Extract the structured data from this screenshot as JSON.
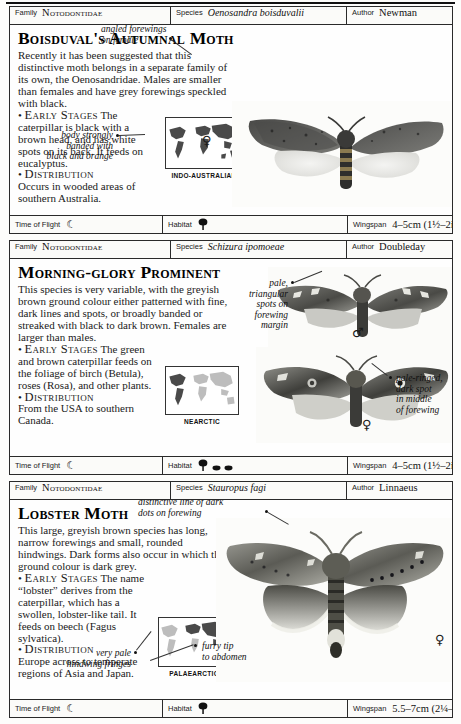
{
  "page": {
    "meta_labels": {
      "family": "Family",
      "species": "Species",
      "author": "Author"
    },
    "foot_labels": {
      "time_of_flight": "Time of Flight",
      "habitat": "Habitat",
      "wingspan": "Wingspan"
    }
  },
  "entries": [
    {
      "family": "Notodontidae",
      "species": "Oenosandra boisduvalii",
      "author": "Newman",
      "common_name": "Boisduval's Autumnal Moth",
      "description": "Recently it has been suggested that this distinctive moth belongs in a separate family of its own, the Oenosandridae. Males are smaller than females and have grey forewings speckled with black.",
      "early_stages_heading": "Early Stages",
      "early_stages": "The caterpillar is black with a brown head, and has white spots on its back. It feeds on eucalyptus.",
      "distribution_heading": "Distribution",
      "distribution": "Occurs in wooded areas of southern Australia.",
      "map_caption": "INDO-AUSTRALIAN",
      "annotations": [
        {
          "text_lines": [
            "angled forewings",
            "on female"
          ],
          "name": "annotation-angled-forewings"
        },
        {
          "text_lines": [
            "body strongly",
            "banded with",
            "black and orange"
          ],
          "name": "annotation-body-banded"
        }
      ],
      "sex_symbols": [
        "♀"
      ],
      "time_of_flight_icon": "moon-icon",
      "habitat_icons": [
        "tree-icon"
      ],
      "wingspan": "4–5cm (1½–2in)"
    },
    {
      "family": "Notodontidae",
      "species": "Schizura ipomoeae",
      "author": "Doubleday",
      "common_name": "Morning-glory Prominent",
      "description": "This species is very variable, with the greyish brown ground colour either patterned with fine, dark lines and spots, or broadly banded or streaked with black to dark brown. Females are larger than males.",
      "early_stages_heading": "Early Stages",
      "early_stages": "The green and brown caterpillar feeds on the foliage of birch (Betula), roses (Rosa), and other plants.",
      "distribution_heading": "Distribution",
      "distribution": "From the USA to southern Canada.",
      "map_caption": "NEARCTIC",
      "annotations": [
        {
          "text_lines": [
            "pale,",
            "triangular",
            "spots on",
            "forewing",
            "margin"
          ],
          "name": "annotation-pale-triangular-spots"
        },
        {
          "text_lines": [
            "pale-ringed,",
            "dark spot",
            "in middle",
            "of forewing"
          ],
          "name": "annotation-pale-ringed-spot"
        }
      ],
      "sex_symbols": [
        "♂",
        "♀"
      ],
      "time_of_flight_icon": "moon-icon",
      "habitat_icons": [
        "tree-icon",
        "shrub-icon",
        "shrub-icon"
      ],
      "wingspan": "4–5cm (1½–2in)"
    },
    {
      "family": "Notodontidae",
      "species": "Stauropus fagi",
      "author": "Linnaeus",
      "common_name": "Lobster Moth",
      "description": "This large, greyish brown species has long, narrow forewings and small, rounded hindwings. Dark forms also occur in which the ground colour is dark grey.",
      "early_stages_heading": "Early Stages",
      "early_stages": "The name “lobster” derives from the caterpillar, which has a swollen, lobster-like tail. It feeds on beech (Fagus sylvatica).",
      "distribution_heading": "Distribution",
      "distribution": "Europe across to temperate regions of Asia and Japan.",
      "map_caption": "PALAEARCTIC",
      "annotations": [
        {
          "text_lines": [
            "distinctive line of dark",
            "dots on forewing"
          ],
          "name": "annotation-dark-dots"
        },
        {
          "text_lines": [
            "very pale",
            "hindwing fringes"
          ],
          "name": "annotation-pale-fringes"
        },
        {
          "text_lines": [
            "furry tip",
            "to abdomen"
          ],
          "name": "annotation-furry-tip"
        }
      ],
      "sex_symbols": [
        "♀"
      ],
      "time_of_flight_icon": "moon-icon",
      "habitat_icons": [
        "tree-icon"
      ],
      "wingspan": "5.5–7cm (2¼–2¾ in)"
    }
  ],
  "colors": {
    "rule": "#2a2a2a",
    "text": "#111111",
    "paper": "#fdfdfb",
    "map_land": "#4a4a4a"
  }
}
